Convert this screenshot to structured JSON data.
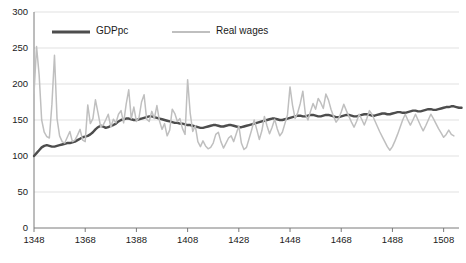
{
  "chart_data": {
    "type": "line",
    "title": "",
    "xlabel": "",
    "ylabel": "",
    "xlim": [
      1348,
      1514
    ],
    "ylim": [
      0,
      300
    ],
    "grid": true,
    "grid_color": "#d9d9d9",
    "background": "#ffffff",
    "legend_position": "top-left-inside",
    "yticks": [
      0,
      50,
      100,
      150,
      200,
      250,
      300
    ],
    "ytick_labels": [
      "0",
      "50",
      "100",
      "150",
      "200",
      "250",
      "300"
    ],
    "xticks": [
      1348,
      1368,
      1388,
      1408,
      1428,
      1448,
      1468,
      1488,
      1508
    ],
    "xtick_labels": [
      "1348",
      "1368",
      "1388",
      "1408",
      "1428",
      "1448",
      "1468",
      "1488",
      "1508"
    ],
    "series": [
      {
        "name": "GDPpc",
        "color": "#4d4d4d",
        "width": 2.4,
        "x_start": 1348,
        "values": [
          100,
          104,
          108,
          112,
          114,
          115,
          114,
          113,
          113,
          114,
          115,
          116,
          117,
          118,
          118,
          119,
          120,
          122,
          124,
          126,
          127,
          128,
          130,
          133,
          137,
          140,
          142,
          141,
          139,
          140,
          142,
          143,
          145,
          148,
          150,
          151,
          152,
          152,
          151,
          150,
          150,
          151,
          152,
          153,
          154,
          155,
          155,
          154,
          153,
          152,
          151,
          150,
          149,
          148,
          147,
          146,
          146,
          145,
          145,
          144,
          143,
          143,
          142,
          141,
          140,
          139,
          139,
          140,
          141,
          142,
          143,
          143,
          142,
          141,
          141,
          142,
          143,
          143,
          142,
          141,
          140,
          140,
          141,
          142,
          143,
          144,
          145,
          146,
          147,
          148,
          149,
          150,
          151,
          152,
          152,
          151,
          150,
          150,
          151,
          152,
          153,
          154,
          155,
          156,
          156,
          155,
          155,
          156,
          157,
          157,
          156,
          155,
          155,
          156,
          157,
          157,
          156,
          155,
          154,
          154,
          155,
          156,
          157,
          157,
          156,
          155,
          155,
          156,
          157,
          158,
          158,
          157,
          156,
          156,
          157,
          158,
          159,
          159,
          158,
          158,
          159,
          160,
          161,
          161,
          160,
          160,
          161,
          162,
          163,
          163,
          162,
          162,
          163,
          164,
          165,
          165,
          164,
          164,
          165,
          166,
          167,
          168,
          168,
          169,
          169,
          168,
          167,
          167
        ]
      },
      {
        "name": "Real wages",
        "color": "#bfbfbf",
        "width": 1.5,
        "x_start": 1348,
        "values": [
          187,
          252,
          213,
          150,
          133,
          127,
          125,
          172,
          240,
          152,
          128,
          120,
          118,
          126,
          134,
          120,
          122,
          129,
          137,
          122,
          120,
          171,
          145,
          152,
          178,
          160,
          141,
          143,
          150,
          158,
          140,
          151,
          146,
          158,
          163,
          146,
          172,
          192,
          152,
          168,
          148,
          153,
          175,
          185,
          151,
          148,
          162,
          152,
          170,
          149,
          137,
          145,
          128,
          136,
          165,
          159,
          148,
          152,
          138,
          130,
          206,
          160,
          134,
          142,
          120,
          113,
          121,
          114,
          110,
          112,
          118,
          130,
          133,
          120,
          111,
          118,
          125,
          128,
          120,
          131,
          142,
          118,
          109,
          112,
          124,
          136,
          150,
          137,
          123,
          135,
          155,
          142,
          131,
          140,
          151,
          138,
          128,
          133,
          145,
          157,
          196,
          170,
          152,
          160,
          173,
          190,
          158,
          150,
          162,
          173,
          165,
          180,
          174,
          166,
          186,
          178,
          165,
          155,
          147,
          152,
          161,
          172,
          163,
          155,
          147,
          140,
          148,
          158,
          151,
          143,
          152,
          163,
          158,
          150,
          142,
          134,
          127,
          120,
          113,
          108,
          113,
          121,
          130,
          140,
          150,
          158,
          150,
          143,
          150,
          158,
          150,
          142,
          135,
          142,
          150,
          158,
          152,
          145,
          138,
          132,
          126,
          130,
          136,
          130,
          128
        ]
      }
    ],
    "legend": [
      {
        "label": "GDPpc",
        "color": "#4d4d4d",
        "width": 2.8
      },
      {
        "label": "Real wages",
        "color": "#bfbfbf",
        "width": 2.0
      }
    ]
  }
}
